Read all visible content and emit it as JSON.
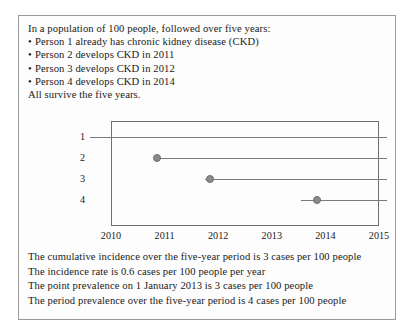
{
  "figure": {
    "premise": {
      "intro": "In a population of 100 people, followed over five years:",
      "bullet_marker": "•",
      "bullets": [
        "Person 1 already has chronic kidney disease (CKD)",
        "Person 2 develops CKD in 2011",
        "Person 3 develops CKD in 2012",
        "Person 4 develops CKD in 2014"
      ],
      "closing": "All survive the five years."
    },
    "conclusions": [
      "The cumulative incidence over the five-year period is 3 cases per 100 people",
      "The incidence rate is 0.6 cases per 100 people per year",
      "The point prevalence on 1 January 2013 is 3 cases per 100 people",
      "The period prevalence over the five-year period is 4 cases per 100 people"
    ]
  },
  "chart_data": {
    "type": "line",
    "title": "",
    "xlabel": "",
    "ylabel": "",
    "grid": false,
    "legend": null,
    "xlim": [
      2010,
      2015
    ],
    "x_ticks": [
      "2010",
      "2011",
      "2012",
      "2013",
      "2014",
      "2015"
    ],
    "y_ticks": [
      "1",
      "2",
      "3",
      "4"
    ],
    "ylim_categories": [
      1,
      2,
      3,
      4
    ],
    "marker_color": "#8a8a8a",
    "line_color": "#7a7a7a",
    "box_color": "#6e6e6e",
    "series": [
      {
        "name": "Person 1",
        "person": 1,
        "onset_year": null,
        "onset_label": "already has CKD before 2010",
        "line_start": 2009.6,
        "line_end": 2015.15,
        "has_marker": false
      },
      {
        "name": "Person 2",
        "person": 2,
        "onset_year": 2011,
        "onset_label": "develops CKD in 2011",
        "line_start": 2010.85,
        "line_end": 2015.15,
        "has_marker": true
      },
      {
        "name": "Person 3",
        "person": 3,
        "onset_year": 2012,
        "onset_label": "develops CKD in 2012",
        "line_start": 2011.75,
        "line_end": 2015.15,
        "has_marker": true
      },
      {
        "name": "Person 4",
        "person": 4,
        "onset_year": 2014,
        "onset_label": "develops CKD in 2014",
        "line_start": 2013.55,
        "line_end": 2015.15,
        "has_marker": true
      }
    ]
  }
}
